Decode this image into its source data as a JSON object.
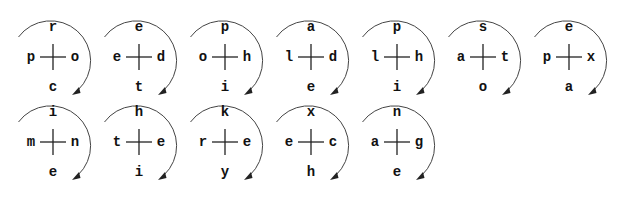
{
  "diagram": {
    "colors": {
      "text": "#111111",
      "cross": "#222222",
      "arc": "#444444"
    },
    "rows": [
      {
        "glyphs": [
          {
            "top": "r",
            "left": "p",
            "right": "o",
            "bottom": "c"
          },
          {
            "top": "e",
            "left": "e",
            "right": "d",
            "bottom": "t"
          },
          {
            "top": "p",
            "left": "o",
            "right": "h",
            "bottom": "i"
          },
          {
            "top": "a",
            "left": "l",
            "right": "d",
            "bottom": "e"
          },
          {
            "top": "p",
            "left": "l",
            "right": "h",
            "bottom": "i"
          },
          {
            "top": "s",
            "left": "a",
            "right": "t",
            "bottom": "o"
          },
          {
            "top": "e",
            "left": "p",
            "right": "x",
            "bottom": "a"
          }
        ]
      },
      {
        "glyphs": [
          {
            "top": "i",
            "left": "m",
            "right": "n",
            "bottom": "e"
          },
          {
            "top": "h",
            "left": "t",
            "right": "e",
            "bottom": "i"
          },
          {
            "top": "k",
            "left": "r",
            "right": "e",
            "bottom": "y"
          },
          {
            "top": "x",
            "left": "e",
            "right": "c",
            "bottom": "h"
          },
          {
            "top": "n",
            "left": "a",
            "right": "g",
            "bottom": "e"
          }
        ]
      }
    ]
  }
}
